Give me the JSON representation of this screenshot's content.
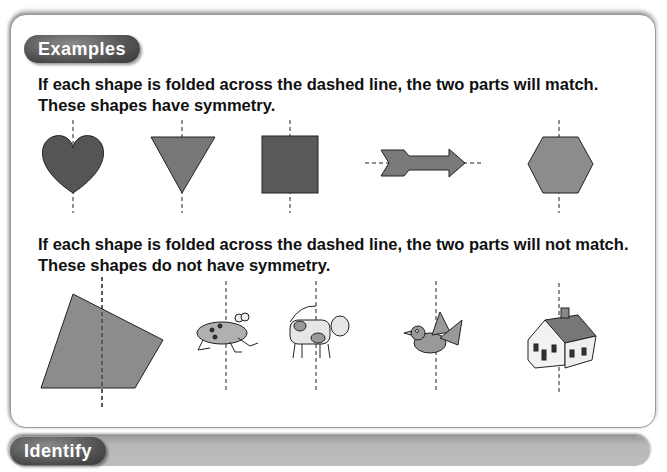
{
  "sections": {
    "examples": {
      "label": "Examples",
      "symmetric_text_line1": "If each shape is folded across the dashed line, the two parts will match.",
      "symmetric_text_line2": "These shapes have symmetry.",
      "symmetric_shapes": [
        "heart",
        "triangle",
        "square",
        "arrow",
        "hexagon"
      ],
      "asymmetric_text_line1": "If each shape is folded across the dashed line, the two parts will not match.",
      "asymmetric_text_line2": "These shapes do not have symmetry.",
      "asymmetric_shapes": [
        "quadrilateral",
        "frog",
        "cow",
        "bird",
        "house"
      ]
    },
    "identify": {
      "label": "Identify"
    }
  },
  "colors": {
    "shape_dark": "#555555",
    "shape_mid": "#8c8c8c",
    "pill": "#4a4a4a"
  }
}
